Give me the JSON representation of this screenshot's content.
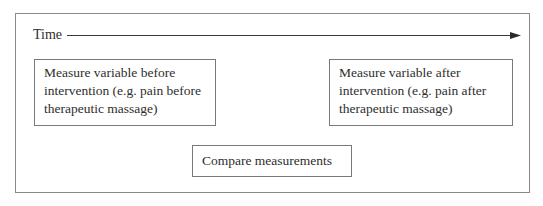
{
  "diagram": {
    "time_axis": {
      "label": "Time",
      "direction": "left-to-right"
    },
    "nodes": [
      {
        "id": "before",
        "lines": [
          "Measure variable before",
          "intervention (e.g. pain before",
          "therapeutic massage)"
        ]
      },
      {
        "id": "after",
        "lines": [
          "Measure variable after",
          "intervention (e.g. pain after",
          "therapeutic massage)"
        ]
      },
      {
        "id": "compare",
        "lines": [
          "Compare measurements"
        ]
      }
    ]
  },
  "colors": {
    "border": "#7a7a7a",
    "text": "#2e2e2e",
    "arrow": "#2a2a2a"
  }
}
